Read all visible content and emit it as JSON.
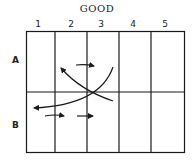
{
  "title": "GOOD",
  "columns": [
    "1",
    "2",
    "3",
    "4",
    "5"
  ],
  "rows": [
    "A",
    "B"
  ],
  "colors": {
    "ink": "#1a1a1a",
    "background": "#ffffff"
  }
}
